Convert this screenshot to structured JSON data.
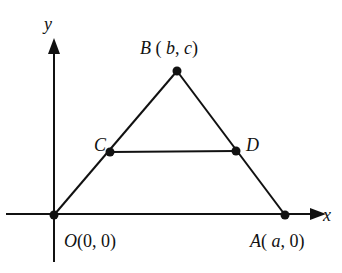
{
  "diagram": {
    "type": "coordinate-geometry",
    "axes": {
      "x_label": "x",
      "y_label": "y"
    },
    "points": {
      "O": {
        "name": "O",
        "coords": "(0, 0)",
        "px": [
          54,
          215
        ]
      },
      "A": {
        "name": "A",
        "coords_open": "( ",
        "coord1": "a",
        "coord_rest": ", 0)",
        "px": [
          285,
          215
        ]
      },
      "B": {
        "name": "B",
        "coords_open": " ( ",
        "coord1": "b",
        "sep": ", ",
        "coord2": "c",
        "coords_close": ")",
        "px": [
          177,
          71
        ]
      },
      "C": {
        "name": "C",
        "px": [
          110,
          152
        ]
      },
      "D": {
        "name": "D",
        "px": [
          236,
          151
        ]
      }
    },
    "segments": [
      "OB",
      "BA",
      "CD"
    ],
    "colors": {
      "stroke": "#111111",
      "background": "#ffffff"
    }
  }
}
